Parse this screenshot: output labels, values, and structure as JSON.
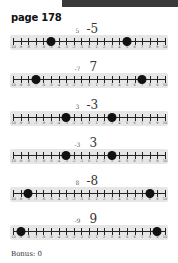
{
  "header": {
    "title": "page 178"
  },
  "number_line": {
    "min": -10,
    "max": 10,
    "tick_labels": [
      "-10",
      "-9",
      "-8",
      "-7",
      "-6",
      "-5",
      "-4",
      "-3",
      "-2",
      "-1",
      "0",
      "1",
      "2",
      "3",
      "4",
      "5",
      "6",
      "7",
      "8",
      "9",
      "10"
    ]
  },
  "problems": [
    {
      "prompt": "5",
      "answer": "-5",
      "points": [
        -5,
        5
      ]
    },
    {
      "prompt": "-7",
      "answer": "7",
      "points": [
        -7,
        7
      ]
    },
    {
      "prompt": "3",
      "answer": "-3",
      "points": [
        -3,
        3
      ]
    },
    {
      "prompt": "-3",
      "answer": "3",
      "points": [
        -3,
        3
      ]
    },
    {
      "prompt": "8",
      "answer": "-8",
      "points": [
        -8,
        8
      ]
    },
    {
      "prompt": "-9",
      "answer": "9",
      "points": [
        -9,
        9
      ]
    }
  ],
  "footer": {
    "bonus_label": "Bonus: 0"
  },
  "colors": {
    "topbar": "#3a3a3a",
    "numline_bg": "#e6e6e6",
    "dot": "#111111"
  }
}
